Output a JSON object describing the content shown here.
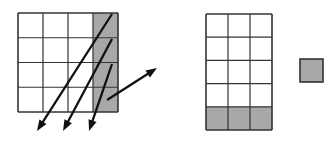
{
  "figure": {
    "type": "diagram",
    "background_color": "#ffffff",
    "stroke_color": "#333333",
    "shade_color": "#a8a8a8",
    "arrow_color": "#111111"
  },
  "left_grid": {
    "name": "left-grid",
    "columns": 4,
    "rows": 4,
    "x": 18,
    "y": 13,
    "width": 100,
    "height": 99,
    "cell_width": 25,
    "cell_height": 24.75,
    "shaded_cells": [
      {
        "col": 3,
        "row": 0
      },
      {
        "col": 3,
        "row": 1
      },
      {
        "col": 3,
        "row": 2
      },
      {
        "col": 3,
        "row": 3
      }
    ],
    "shaded_region_label": "rightmost-column"
  },
  "right_grid": {
    "name": "right-grid",
    "columns": 3,
    "rows": 5,
    "x": 206,
    "y": 14,
    "width": 66,
    "height": 116,
    "cell_width": 22,
    "cell_height": 23.2,
    "shaded_cells": [
      {
        "col": 0,
        "row": 4
      },
      {
        "col": 1,
        "row": 4
      },
      {
        "col": 2,
        "row": 4
      }
    ],
    "shaded_region_label": "bottom-row"
  },
  "isolated_square": {
    "name": "isolated-square",
    "x": 300,
    "y": 59,
    "width": 23,
    "height": 23
  },
  "arrows": [
    {
      "name": "arrow-down-left-1",
      "x1": 112,
      "y1": 14,
      "x2": 37,
      "y2": 131,
      "direction": "down-left"
    },
    {
      "name": "arrow-down-left-2",
      "x1": 112,
      "y1": 39,
      "x2": 63,
      "y2": 131,
      "direction": "down-left"
    },
    {
      "name": "arrow-down-left-3",
      "x1": 112,
      "y1": 64,
      "x2": 89,
      "y2": 131,
      "direction": "down-left"
    },
    {
      "name": "arrow-up-right-1",
      "x1": 107,
      "y1": 100,
      "x2": 157,
      "y2": 68,
      "direction": "up-right"
    }
  ]
}
